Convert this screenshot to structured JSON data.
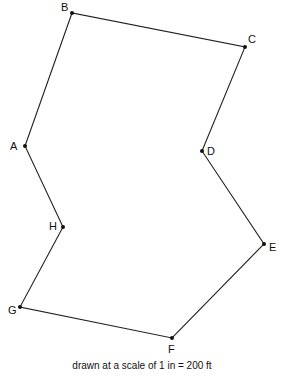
{
  "diagram": {
    "type": "polygon-survey-plot",
    "stroke_color": "#222222",
    "vertices": [
      {
        "label": "A",
        "x": 25,
        "y": 146,
        "lx": 10,
        "ly": 150
      },
      {
        "label": "B",
        "x": 72,
        "y": 13,
        "lx": 61,
        "ly": 11
      },
      {
        "label": "C",
        "x": 245,
        "y": 47,
        "lx": 248,
        "ly": 43
      },
      {
        "label": "D",
        "x": 202,
        "y": 151,
        "lx": 207,
        "ly": 155
      },
      {
        "label": "E",
        "x": 264,
        "y": 244,
        "lx": 269,
        "ly": 251
      },
      {
        "label": "F",
        "x": 172,
        "y": 338,
        "lx": 168,
        "ly": 353
      },
      {
        "label": "G",
        "x": 20,
        "y": 307,
        "lx": 8,
        "ly": 314
      },
      {
        "label": "H",
        "x": 63,
        "y": 227,
        "lx": 49,
        "ly": 230
      }
    ],
    "caption": "drawn at a scale of 1 in = 200 ft"
  }
}
